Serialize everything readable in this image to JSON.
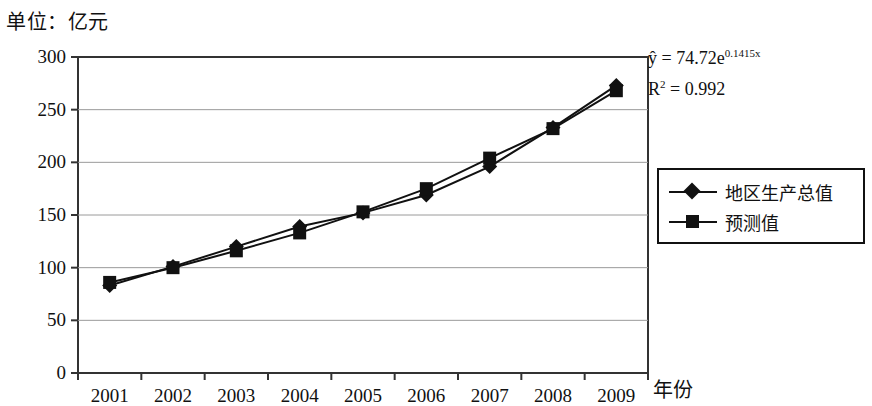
{
  "unit_note": "单位：亿元",
  "annotation": {
    "equation_prefix": "ŷ = 74.72e",
    "equation_exponent": "0.1415x",
    "r_squared_prefix": "R",
    "r_squared_sup": "2",
    "r_squared_value": " = 0.992"
  },
  "legend": {
    "position": "right",
    "items": [
      {
        "label": "地区生产总值",
        "marker": "diamond-marker-icon",
        "color": "#111111"
      },
      {
        "label": "预测值",
        "marker": "square-marker-icon",
        "color": "#111111"
      }
    ]
  },
  "chart_data": {
    "type": "line",
    "title": "",
    "subtitle": "",
    "unit": "单位：亿元",
    "xlabel": "年份",
    "ylabel": "",
    "categories": [
      "2001",
      "2002",
      "2003",
      "2004",
      "2005",
      "2006",
      "2007",
      "2008",
      "2009"
    ],
    "series": [
      {
        "name": "地区生产总值",
        "marker": "diamond",
        "color": "#111111",
        "values": [
          83,
          101,
          120,
          139,
          152,
          169,
          196,
          233,
          273
        ]
      },
      {
        "name": "预测值",
        "marker": "square",
        "color": "#111111",
        "values": [
          86,
          100,
          116,
          133,
          153,
          175,
          204,
          232,
          268
        ]
      }
    ],
    "ylim": [
      0,
      300
    ],
    "yticks": [
      "0",
      "50",
      "100",
      "150",
      "200",
      "250",
      "300"
    ],
    "ytick_values": [
      0,
      50,
      100,
      150,
      200,
      250,
      300
    ],
    "grid": "horizontal",
    "legend_position": "right",
    "annotations": [
      "ŷ = 74.72e0.1415x",
      "R2 = 0.992"
    ]
  }
}
